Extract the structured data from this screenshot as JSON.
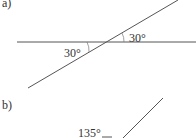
{
  "parts": {
    "a": {
      "label": "a)",
      "angle1": "30°",
      "angle2": "30°"
    },
    "b": {
      "label": "b)",
      "angle": "135°"
    }
  },
  "colors": {
    "line": "#555555",
    "text": "#333333"
  }
}
